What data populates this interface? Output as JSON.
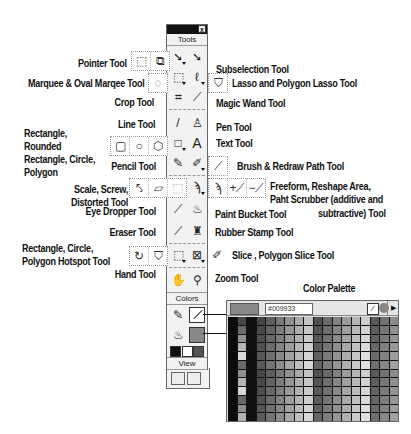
{
  "panel": {
    "title": "Tools",
    "close": "x",
    "colors_header": "Colors",
    "view_header": "View"
  },
  "labels": {
    "pointer": "Pointer Tool",
    "subselection": "Subselection Tool",
    "marquee": "Marquee & Oval Marqee Tool",
    "lasso": "Lasso and Polygon Lasso Tool",
    "crop": "Crop Tool",
    "magic_wand": "Magic Wand Tool",
    "line": "Line Tool",
    "pen": "Pen Tool",
    "rect_shapes": "Rectangle, Rounded Rectangle, Circle, Polygon",
    "text": "Text Tool",
    "pencil": "Pencil Tool",
    "brush": "Brush & Redraw Path Tool",
    "scale": "Scale, Screw, Distorted Tool",
    "freeform": "Freeform, Reshape Area, Paht Scrubber (additive and",
    "freeform2": "subtractive) Tool",
    "eye_dropper": "Eye Dropper Tool",
    "paint_bucket": "Paint Bucket Tool",
    "eraser": "Eraser Tool",
    "rubber_stamp": "Rubber Stamp Tool",
    "hotspot": "Rectangle, Circle, Polygon Hotspot Tool",
    "slice": "Slice , Polygon Slice Tool",
    "hand": "Hand Tool",
    "zoom": "Zoom Tool",
    "color_palette": "Color Palette"
  },
  "icons": {
    "pointer": "➘",
    "subselection": "➘",
    "marquee": "⬚",
    "lasso": "ℓ",
    "crop": "⌗",
    "magic_wand": "⟋",
    "line": "/",
    "pen": "♙",
    "rectangle": "□",
    "text": "A",
    "pencil": "✎",
    "brush": "✐",
    "scale": "⬚",
    "freeform": "ϡ",
    "eye_dropper": "⟋",
    "paint_bucket": "♨",
    "eraser": "⟋",
    "rubber_stamp": "♜",
    "hotspot": "⬚",
    "slice": "⊠",
    "hand": "✋",
    "zoom": "⚲"
  },
  "palette": {
    "hex_value": "#009933",
    "swatch_color": "#888888"
  }
}
